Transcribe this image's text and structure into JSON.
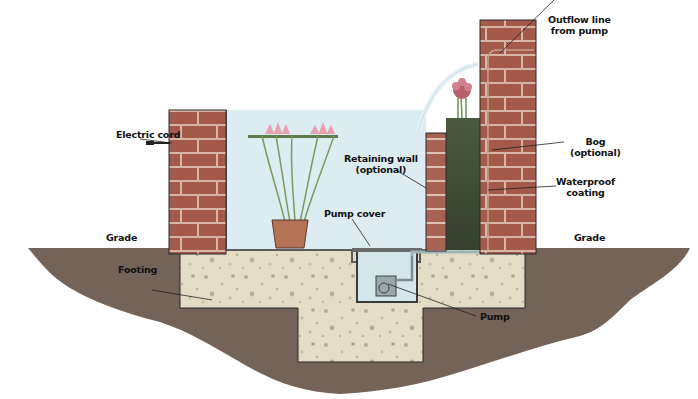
{
  "diagram": {
    "labels": {
      "electric_cord": "Electric cord",
      "outflow_line": [
        "Outflow line",
        "from pump"
      ],
      "bog": [
        "Bog",
        "(optional)"
      ],
      "waterproof": [
        "Waterproof",
        "coating"
      ],
      "retaining_wall": [
        "Retaining wall",
        "(optional)"
      ],
      "pump_cover": "Pump cover",
      "grade_left": "Grade",
      "grade_right": "Grade",
      "footing": "Footing",
      "pump": "Pump"
    },
    "colors": {
      "brick": "#a35a4a",
      "mortar": "#d9b5a8",
      "water": "#dbeef5",
      "soil": "#6e5f58",
      "concrete": "#e3ddc6",
      "speck": "#b8ad98",
      "bog": "#3e4a38",
      "plant": "#7a9a62",
      "flower": "#d98a9a"
    }
  }
}
